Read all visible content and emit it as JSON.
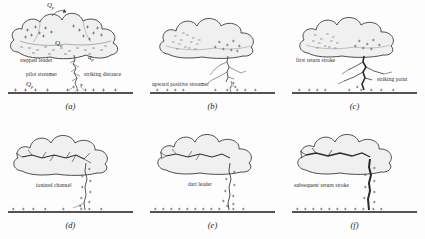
{
  "figure": {
    "background_color": "#fdfdfd",
    "cloud_fill": "#f0f0f0",
    "cloud_stroke": "#3a3a3a",
    "channel_color": "#2a2a2a",
    "ground_color": "#1a1a1a",
    "charge_color": "#555555"
  },
  "panels": [
    {
      "caption": "(a)",
      "labels": [
        "stepped leader",
        "pilot streamer",
        "striking distance"
      ],
      "charge_symbols": [
        "Qp",
        "Qn",
        "Qp",
        "qp"
      ]
    },
    {
      "caption": "(b)",
      "labels": [
        "upward positive streamer"
      ],
      "charge_symbols": []
    },
    {
      "caption": "(c)",
      "labels": [
        "first return stroke",
        "striking point"
      ],
      "charge_symbols": []
    },
    {
      "caption": "(d)",
      "labels": [
        "ionized channel"
      ],
      "charge_symbols": []
    },
    {
      "caption": "(e)",
      "labels": [
        "dart leader"
      ],
      "charge_symbols": []
    },
    {
      "caption": "(f)",
      "labels": [
        "subsequent return stroke"
      ],
      "charge_symbols": []
    }
  ],
  "panel_a": {
    "caption": "(a)",
    "label_stepped_leader": "stepped leader",
    "label_pilot_streamer": "pilot streamer",
    "label_striking_distance": "striking distance",
    "q_top": "Q",
    "q_top_sub": "p",
    "q_cloud": "Q",
    "q_cloud_sub": "n",
    "q_ground": "Q",
    "q_ground_sub": "p",
    "q_small": "q",
    "q_small_sub": "p"
  },
  "panel_b": {
    "caption": "(b)",
    "label_upward_positive_streamer": "upward positive streamer"
  },
  "panel_c": {
    "caption": "(c)",
    "label_first_return_stroke": "first return stroke",
    "label_striking_point": "striking point"
  },
  "panel_d": {
    "caption": "(d)",
    "label_ionized_channel": "ionized channel"
  },
  "panel_e": {
    "caption": "(e)",
    "label_dart_leader": "dart leader"
  },
  "panel_f": {
    "caption": "(f)",
    "label_subsequent_return_stroke": "subsequent return stroke"
  }
}
